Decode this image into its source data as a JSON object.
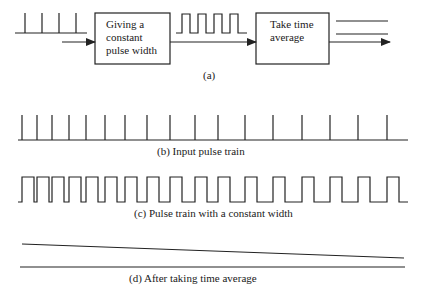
{
  "panel_a": {
    "caption": "(a)",
    "box1": {
      "line1": "Giving a",
      "line2": "constant",
      "line3": "pulse width"
    },
    "box2": {
      "line1": "Take time",
      "line2": "average"
    }
  },
  "panel_b": {
    "caption": "(b) Input pulse train",
    "pulse_x": [
      22,
      37,
      52,
      69,
      86,
      105,
      125,
      147,
      170,
      195,
      218,
      245,
      273,
      302,
      330,
      358,
      387
    ]
  },
  "panel_c": {
    "caption": "(c) Pulse train with a constant width",
    "pulse_width": 12
  },
  "panel_d": {
    "caption": "(d) After taking time average"
  },
  "colors": {
    "stroke": "#222222",
    "text": "#1a1a1a"
  }
}
